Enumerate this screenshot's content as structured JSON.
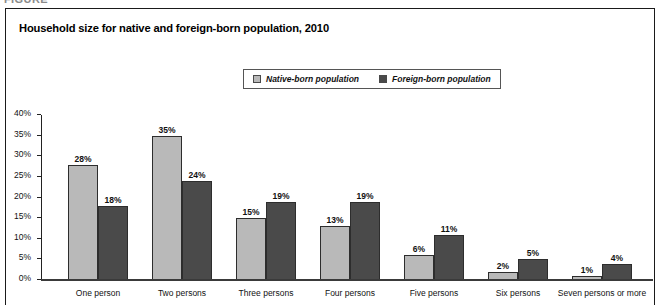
{
  "figure_caption": "FIGURE",
  "title": "Household size for native and foreign-born population, 2010",
  "legend": {
    "native_label": "Native-born population",
    "foreign_label": "Foreign-born population",
    "native_color": "#b9b9b9",
    "foreign_color": "#4a4a4a"
  },
  "chart_data": {
    "type": "bar",
    "title": "Household size for native and foreign-born population, 2010",
    "xlabel": "",
    "ylabel": "",
    "ylim": [
      0,
      40
    ],
    "grid": false,
    "legend_position": "top-center",
    "categories": [
      "One person",
      "Two persons",
      "Three persons",
      "Four persons",
      "Five persons",
      "Six persons",
      "Seven persons or more"
    ],
    "y_ticks": [
      "0%",
      "5%",
      "10%",
      "15%",
      "20%",
      "25%",
      "30%",
      "35%",
      "40%"
    ],
    "y_tick_values": [
      0,
      5,
      10,
      15,
      20,
      25,
      30,
      35,
      40
    ],
    "series": [
      {
        "name": "Native-born population",
        "color": "#b9b9b9",
        "values": [
          28,
          35,
          15,
          13,
          6,
          2,
          1
        ],
        "labels": [
          "28%",
          "35%",
          "15%",
          "13%",
          "6%",
          "2%",
          "1%"
        ]
      },
      {
        "name": "Foreign-born population",
        "color": "#4a4a4a",
        "values": [
          18,
          24,
          19,
          19,
          11,
          5,
          4
        ],
        "labels": [
          "18%",
          "24%",
          "19%",
          "19%",
          "11%",
          "5%",
          "4%"
        ]
      }
    ]
  }
}
